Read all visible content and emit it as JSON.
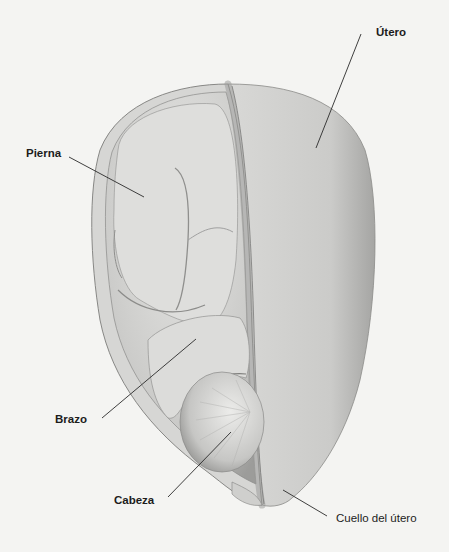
{
  "diagram": {
    "style": "grayscale pencil drawing",
    "background_color": "#f4f4f2",
    "labels": [
      {
        "id": "utero",
        "text": "Útero",
        "x": 376,
        "y": 27,
        "leader": [
          [
            361,
            34
          ],
          [
            316,
            148
          ]
        ]
      },
      {
        "id": "pierna",
        "text": "Pierna",
        "x": 26,
        "y": 148,
        "leader": [
          [
            69,
            157
          ],
          [
            144,
            197
          ]
        ]
      },
      {
        "id": "brazo",
        "text": "Brazo",
        "x": 55,
        "y": 414,
        "leader": [
          [
            102,
            418
          ],
          [
            196,
            339
          ]
        ]
      },
      {
        "id": "cabeza",
        "text": "Cabeza",
        "x": 114,
        "y": 495,
        "leader": [
          [
            168,
            497
          ],
          [
            231,
            432
          ]
        ]
      },
      {
        "id": "cuello",
        "text": "Cuello del útero",
        "x": 336,
        "y": 513,
        "leader": [
          [
            327,
            516
          ],
          [
            283,
            490
          ]
        ]
      }
    ]
  }
}
